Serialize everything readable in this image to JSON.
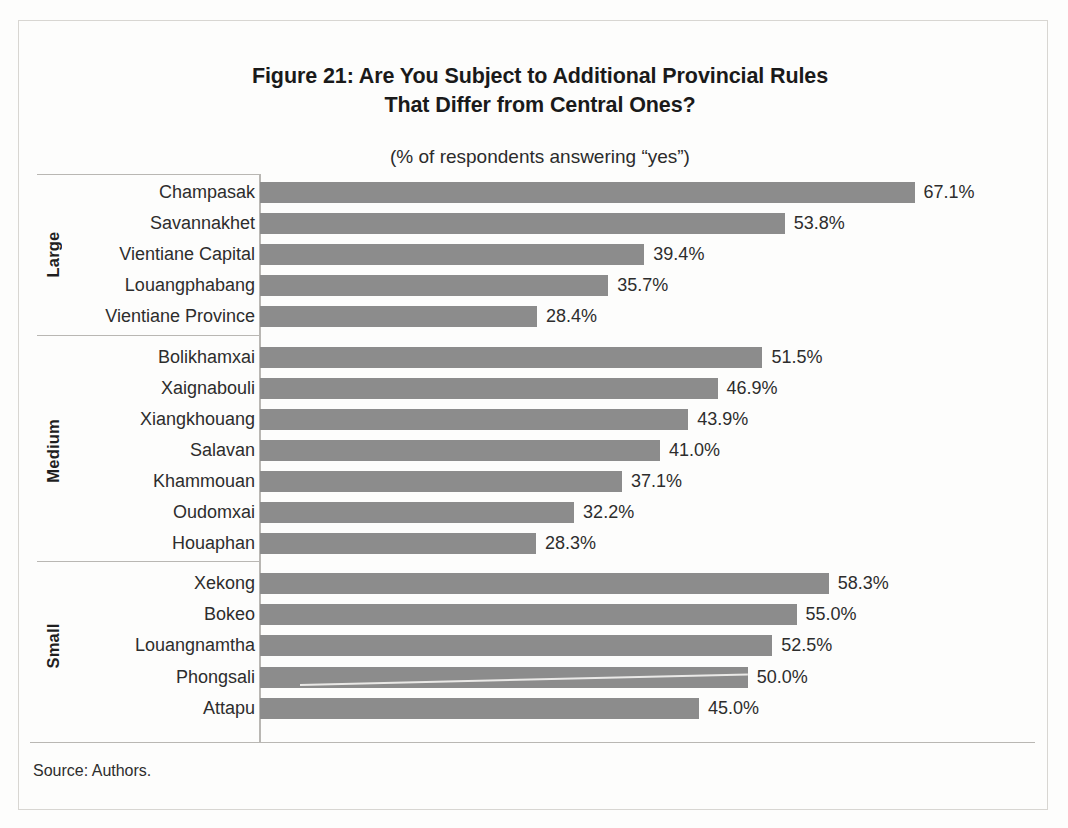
{
  "figure": {
    "title_line1": "Figure 21: Are You Subject to Additional Provincial Rules",
    "title_line2": "That Differ from Central Ones?",
    "subtitle": "(% of respondents answering “yes”)",
    "source": "Source: Authors."
  },
  "colors": {
    "bar": "#8c8c8c",
    "axis": "#b9b7b3",
    "text": "#2d2d2d",
    "page": "#fdfdfc"
  },
  "groups": [
    {
      "label": "Large"
    },
    {
      "label": "Medium"
    },
    {
      "label": "Small"
    }
  ],
  "chart_data": {
    "type": "bar",
    "orientation": "horizontal",
    "title": "Figure 21: Are You Subject to Additional Provincial Rules That Differ from Central Ones?",
    "subtitle": "(% of respondents answering “yes”)",
    "xlabel": "",
    "ylabel": "",
    "xlim": [
      0,
      67.1
    ],
    "grid": false,
    "legend": "none",
    "value_suffix": "%",
    "source": "Source: Authors.",
    "group_field": "Province size",
    "groups": [
      {
        "name": "Large",
        "categories": [
          "Champasak",
          "Savannakhet",
          "Vientiane Capital",
          "Louangphabang",
          "Vientiane Province"
        ],
        "values": [
          67.1,
          53.8,
          39.4,
          35.7,
          28.4
        ],
        "labels": [
          "67.1%",
          "53.8%",
          "39.4%",
          "35.7%",
          "28.4%"
        ]
      },
      {
        "name": "Medium",
        "categories": [
          "Bolikhamxai",
          "Xaignabouli",
          "Xiangkhouang",
          "Salavan",
          "Khammouan",
          "Oudomxai",
          "Houaphan"
        ],
        "values": [
          51.5,
          46.9,
          43.9,
          41.0,
          37.1,
          32.2,
          28.3
        ],
        "labels": [
          "51.5%",
          "46.9%",
          "43.9%",
          "41.0%",
          "37.1%",
          "32.2%",
          "28.3%"
        ]
      },
      {
        "name": "Small",
        "categories": [
          "Xekong",
          "Bokeo",
          "Louangnamtha",
          "Phongsali",
          "Attapu"
        ],
        "values": [
          58.3,
          55.0,
          52.5,
          50.0,
          45.0
        ],
        "labels": [
          "58.3%",
          "55.0%",
          "52.5%",
          "50.0%",
          "45.0%"
        ]
      }
    ],
    "categories": [
      "Champasak",
      "Savannakhet",
      "Vientiane Capital",
      "Louangphabang",
      "Vientiane Province",
      "Bolikhamxai",
      "Xaignabouli",
      "Xiangkhouang",
      "Salavan",
      "Khammouan",
      "Oudomxai",
      "Houaphan",
      "Xekong",
      "Bokeo",
      "Louangnamtha",
      "Phongsali",
      "Attapu"
    ],
    "values": [
      67.1,
      53.8,
      39.4,
      35.7,
      28.4,
      51.5,
      46.9,
      43.9,
      41.0,
      37.1,
      32.2,
      28.3,
      58.3,
      55.0,
      52.5,
      50.0,
      45.0
    ]
  }
}
